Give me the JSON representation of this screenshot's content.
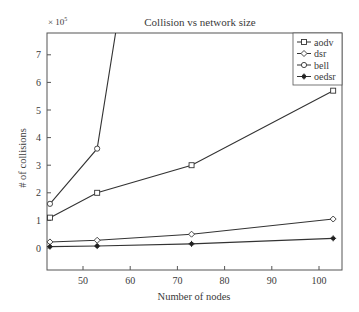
{
  "chart_data": {
    "type": "line",
    "title": "Collision vs network size",
    "xlabel": "Number of nodes",
    "ylabel": "# of collisions",
    "y_multiplier_label": "× 10^5",
    "y_multiplier": 100000,
    "xlim": [
      42.4,
      104.7
    ],
    "ylim": [
      -0.8,
      7.8
    ],
    "xticks": [
      50,
      60,
      70,
      80,
      90,
      100
    ],
    "yticks": [
      0,
      1,
      2,
      3,
      4,
      5,
      6,
      7
    ],
    "grid": false,
    "legend_position": "upper right",
    "x": [
      43,
      53,
      73,
      103
    ],
    "series": [
      {
        "name": "aodv",
        "marker": "square",
        "values": [
          1.1,
          2.0,
          3.0,
          5.7
        ]
      },
      {
        "name": "dsr",
        "marker": "diamond",
        "values": [
          0.22,
          0.28,
          0.5,
          1.05
        ]
      },
      {
        "name": "bell",
        "marker": "circle",
        "values": [
          1.6,
          3.6,
          null,
          null
        ],
        "note": "line continues off top of plot past ~57 nodes"
      },
      {
        "name": "oedsr",
        "marker": "star",
        "values": [
          0.05,
          0.07,
          0.15,
          0.35
        ]
      }
    ]
  }
}
